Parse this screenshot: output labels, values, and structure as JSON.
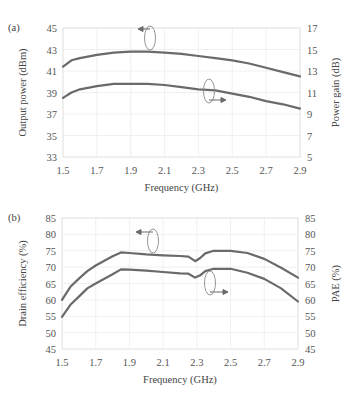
{
  "chart_data": [
    {
      "panel": "(a)",
      "type": "line",
      "title": "",
      "xlabel": "Frequency (GHz)",
      "ylabel": "Output power (dBm)",
      "y2label": "Power gain (dB)",
      "xlim": [
        1.5,
        2.9
      ],
      "ylim": [
        33,
        45
      ],
      "y2lim": [
        5,
        17
      ],
      "xticks": [
        "1.5",
        "1.7",
        "1.9",
        "2.1",
        "2.3",
        "2.5",
        "2.7",
        "2.9"
      ],
      "yticks": [
        "33",
        "35",
        "37",
        "39",
        "41",
        "43",
        "45"
      ],
      "y2ticks": [
        "5",
        "7",
        "9",
        "11",
        "13",
        "15",
        "17"
      ],
      "grid": true,
      "x": [
        1.5,
        1.55,
        1.6,
        1.7,
        1.8,
        1.9,
        2.0,
        2.1,
        2.2,
        2.3,
        2.4,
        2.5,
        2.6,
        2.7,
        2.8,
        2.9
      ],
      "series": [
        {
          "name": "Output power",
          "axis": "left",
          "values": [
            41.4,
            42.0,
            42.2,
            42.5,
            42.7,
            42.8,
            42.8,
            42.7,
            42.6,
            42.4,
            42.2,
            42.0,
            41.7,
            41.3,
            40.9,
            40.5
          ]
        },
        {
          "name": "Power gain",
          "axis": "right",
          "values": [
            10.5,
            11.0,
            11.3,
            11.6,
            11.8,
            11.8,
            11.8,
            11.7,
            11.5,
            11.3,
            11.2,
            10.9,
            10.6,
            10.2,
            9.9,
            9.5
          ]
        }
      ],
      "annotations": [
        "left arrow marks output power curve",
        "right arrow marks power gain curve"
      ]
    },
    {
      "panel": "(b)",
      "type": "line",
      "title": "",
      "xlabel": "Frequency (GHz)",
      "ylabel": "Drain efficiency (%)",
      "y2label": "PAE (%)",
      "xlim": [
        1.5,
        2.9
      ],
      "ylim": [
        45,
        85
      ],
      "y2lim": [
        45,
        85
      ],
      "xticks": [
        "1.5",
        "1.7",
        "1.9",
        "2.1",
        "2.3",
        "2.5",
        "2.7",
        "2.9"
      ],
      "yticks": [
        "45",
        "50",
        "55",
        "60",
        "65",
        "70",
        "75",
        "80",
        "85"
      ],
      "y2ticks": [
        "45",
        "50",
        "55",
        "60",
        "65",
        "70",
        "75",
        "80",
        "85"
      ],
      "grid": true,
      "x": [
        1.5,
        1.55,
        1.6,
        1.65,
        1.7,
        1.8,
        1.85,
        1.9,
        2.0,
        2.1,
        2.2,
        2.25,
        2.29,
        2.32,
        2.35,
        2.4,
        2.5,
        2.6,
        2.7,
        2.8,
        2.9
      ],
      "series": [
        {
          "name": "Drain efficiency",
          "axis": "left",
          "values": [
            60,
            64,
            66.5,
            68.8,
            70.5,
            73.3,
            74.5,
            74.3,
            73.9,
            73.6,
            73.4,
            73.2,
            71.8,
            72.8,
            74.2,
            75.0,
            75.0,
            74.3,
            72.5,
            69.8,
            66.8
          ]
        },
        {
          "name": "PAE",
          "axis": "right",
          "values": [
            54.8,
            58.5,
            61,
            63.5,
            65,
            67.8,
            69.3,
            69.2,
            68.9,
            68.5,
            68.1,
            68.0,
            66.8,
            67.5,
            68.8,
            69.5,
            69.5,
            68.3,
            66.4,
            63.5,
            59.5
          ]
        }
      ],
      "annotations": [
        "left arrow marks drain efficiency curve",
        "right arrow marks PAE curve"
      ]
    }
  ]
}
